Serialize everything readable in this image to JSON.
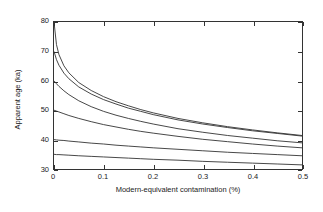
{
  "chart_data": {
    "type": "line",
    "title": "",
    "xlabel": "Modern-equivalent contamination (%)",
    "ylabel": "Apparent age (ka)",
    "xlim": [
      0,
      0.5
    ],
    "ylim": [
      30,
      80
    ],
    "xticks": [
      0,
      0.1,
      0.2,
      0.3,
      0.4,
      0.5
    ],
    "xticklabels": [
      "0",
      "0.1",
      "0.2",
      "0.3",
      "0.4",
      "0.5"
    ],
    "yticks": [
      30,
      40,
      50,
      60,
      70,
      80
    ],
    "yticklabels": [
      "30",
      "40",
      "50",
      "60",
      "70",
      "80"
    ],
    "grid": false,
    "legend": false,
    "line_color": "#333333",
    "x": [
      0,
      0.005,
      0.01,
      0.02,
      0.03,
      0.05,
      0.075,
      0.1,
      0.125,
      0.15,
      0.175,
      0.2,
      0.25,
      0.3,
      0.35,
      0.4,
      0.45,
      0.5
    ],
    "series": [
      {
        "name": "true age 80 ka",
        "true_age": 80,
        "values": [
          80.0,
          72.3,
          68.9,
          65.1,
          62.7,
          59.4,
          56.7,
          54.6,
          52.9,
          51.5,
          50.2,
          49.1,
          47.2,
          45.7,
          44.4,
          43.3,
          42.3,
          41.4
        ]
      },
      {
        "name": "true age 70 ka",
        "true_age": 70,
        "values": [
          70.0,
          67.2,
          65.3,
          62.6,
          60.7,
          57.9,
          55.5,
          53.6,
          52.1,
          50.7,
          49.6,
          48.5,
          46.7,
          45.3,
          44.1,
          43.0,
          42.1,
          41.2
        ]
      },
      {
        "name": "true age 60 ka",
        "true_age": 60,
        "values": [
          60.0,
          59.0,
          58.1,
          56.6,
          55.3,
          53.2,
          51.2,
          49.6,
          48.3,
          47.2,
          46.2,
          45.3,
          43.7,
          42.5,
          41.4,
          40.5,
          39.6,
          38.9
        ]
      },
      {
        "name": "true age 50 ka",
        "true_age": 50,
        "values": [
          50.0,
          49.7,
          49.4,
          48.8,
          48.2,
          47.2,
          46.1,
          45.1,
          44.3,
          43.5,
          42.8,
          42.2,
          41.1,
          40.1,
          39.3,
          38.5,
          37.8,
          37.2
        ]
      },
      {
        "name": "true age 40 ka",
        "true_age": 40,
        "values": [
          40.0,
          39.9,
          39.8,
          39.7,
          39.5,
          39.2,
          38.8,
          38.5,
          38.1,
          37.8,
          37.5,
          37.2,
          36.7,
          36.2,
          35.7,
          35.3,
          34.9,
          34.5
        ]
      },
      {
        "name": "true age 35 ka",
        "true_age": 35,
        "values": [
          35.0,
          34.9,
          34.9,
          34.8,
          34.7,
          34.5,
          34.3,
          34.1,
          33.9,
          33.7,
          33.5,
          33.3,
          33.0,
          32.6,
          32.3,
          32.0,
          31.7,
          31.4
        ]
      }
    ]
  }
}
